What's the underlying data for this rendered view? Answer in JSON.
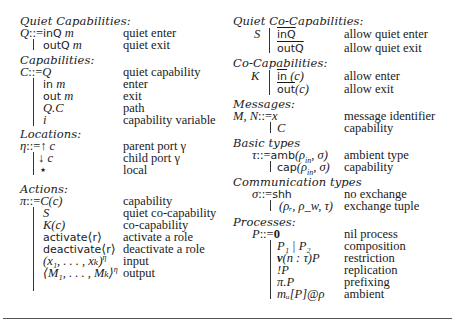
{
  "left": {
    "quiet_capabilities": {
      "heading": "Quiet Capabilities:",
      "lhs": "Q",
      "rows": [
        {
          "term_kw": "inQ",
          "term_var": "m",
          "desc": "quiet enter"
        },
        {
          "term_kw": "outQ",
          "term_var": "m",
          "desc": "quiet exit"
        }
      ]
    },
    "capabilities": {
      "heading": "Capabilities:",
      "lhs": "C",
      "rows": [
        {
          "term": "Q",
          "desc": "quiet capability"
        },
        {
          "term_kw": "in",
          "term_var": "m",
          "desc": "enter"
        },
        {
          "term_kw": "out",
          "term_var": "m",
          "desc": "exit"
        },
        {
          "term": "Q.C",
          "desc": "path"
        },
        {
          "term": "i",
          "desc": "capability variable"
        }
      ]
    },
    "locations": {
      "heading": "Locations:",
      "lhs": "η",
      "rows": [
        {
          "symbol": "↑",
          "term": "c",
          "desc": "parent port γ"
        },
        {
          "symbol": "↓",
          "term": "c",
          "desc": "child port γ"
        },
        {
          "symbol": "⋆",
          "term": "",
          "desc": "local"
        }
      ]
    },
    "actions": {
      "heading": "Actions:",
      "lhs": "π",
      "rows": [
        {
          "term": "C(c)",
          "desc": "capability"
        },
        {
          "term": "S",
          "desc": "quiet co-capability"
        },
        {
          "term": "K(c)",
          "desc": "co-capability"
        },
        {
          "term_kw": "activate",
          "term_arg": "r",
          "desc": "activate a role"
        },
        {
          "term_kw": "deactivate",
          "term_arg": "r",
          "desc": "deactivate a role"
        },
        {
          "term": "(x₁, . . . , xₖ)",
          "sup": "η",
          "desc": "input"
        },
        {
          "term": "⟨M₁, . . . , Mₖ⟩",
          "sup": "η",
          "desc": "output"
        }
      ]
    }
  },
  "right": {
    "quiet_co_capabilities": {
      "heading": "Quiet Co-Capabilities:",
      "lhs": "S",
      "rows": [
        {
          "term_kw": "inQ",
          "desc": "allow quiet enter"
        },
        {
          "term_kw": "outQ",
          "desc": "allow quiet exit"
        }
      ]
    },
    "co_capabilities": {
      "heading": "Co-Capabilities:",
      "lhs": "K",
      "rows": [
        {
          "term_kw": "in",
          "term_arg": "(c)",
          "desc": "allow enter"
        },
        {
          "term_kw": "out",
          "term_arg": "(c)",
          "desc": "allow exit"
        }
      ]
    },
    "messages": {
      "heading": "Messages:",
      "lhs": "M, N",
      "rows": [
        {
          "term": "x",
          "desc": "message identifier"
        },
        {
          "term": "C",
          "desc": "capability"
        }
      ]
    },
    "basic_types": {
      "heading": "Basic types",
      "lhs": "τ",
      "rows": [
        {
          "term_kw": "amb",
          "term_arg": "(ρ",
          "sub": "in",
          "term_tail": ", σ)",
          "desc": "ambient type"
        },
        {
          "term_kw": "cap",
          "term_arg": "(ρ",
          "sub": "in",
          "term_tail": ", σ)",
          "desc": "capability"
        }
      ]
    },
    "communication_types": {
      "heading": "Communication types",
      "lhs": "σ",
      "rows": [
        {
          "term_kw": "shh",
          "desc": "no exchange"
        },
        {
          "term": "(ρᵣ, ρ_w, τ)",
          "desc": "exchange tuple"
        }
      ]
    },
    "processes": {
      "heading": "Processes:",
      "lhs": "P",
      "rows": [
        {
          "term": "0",
          "desc": "nil process"
        },
        {
          "term": "P₁ | P₂",
          "desc": "composition"
        },
        {
          "term_kw": "ν",
          "term_arg": "(n : τ)P",
          "desc": "restriction"
        },
        {
          "term": "!P",
          "desc": "replication"
        },
        {
          "term": "π.P",
          "desc": "prefixing"
        },
        {
          "term": "mᵤ[P]@ρ",
          "desc": "ambient"
        }
      ]
    }
  },
  "common": {
    "defines": "::=",
    "alt": "|"
  }
}
